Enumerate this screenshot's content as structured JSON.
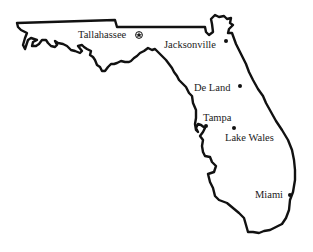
{
  "map": {
    "region": "Florida",
    "colors": {
      "outline": "#111111",
      "background": "#ffffff",
      "text": "#222222"
    },
    "cities": [
      {
        "id": "tallahassee",
        "name": "Tallahassee",
        "marker": "capital-star",
        "capital": true
      },
      {
        "id": "jacksonville",
        "name": "Jacksonville",
        "marker": "dot",
        "capital": false
      },
      {
        "id": "de-land",
        "name": "De Land",
        "marker": "dot",
        "capital": false
      },
      {
        "id": "tampa",
        "name": "Tampa",
        "marker": "dot",
        "capital": false
      },
      {
        "id": "lake-wales",
        "name": "Lake Wales",
        "marker": "dot",
        "capital": false
      },
      {
        "id": "miami",
        "name": "Miami",
        "marker": "dot",
        "capital": false
      }
    ]
  }
}
